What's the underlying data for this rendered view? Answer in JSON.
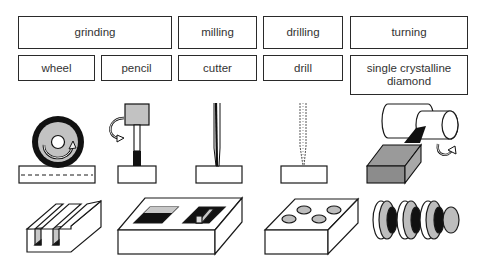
{
  "processes": [
    {
      "label": "grinding",
      "tools": [
        "wheel",
        "pencil"
      ]
    },
    {
      "label": "milling",
      "tools": [
        "cutter"
      ]
    },
    {
      "label": "drilling",
      "tools": [
        "drill"
      ]
    },
    {
      "label": "turning",
      "tools": [
        "single crystalline diamond"
      ]
    }
  ],
  "colors": {
    "line": "#1a1a1a",
    "gray": "#bdbdbd",
    "dark_gray": "#8c8c8c",
    "black": "#111111"
  }
}
